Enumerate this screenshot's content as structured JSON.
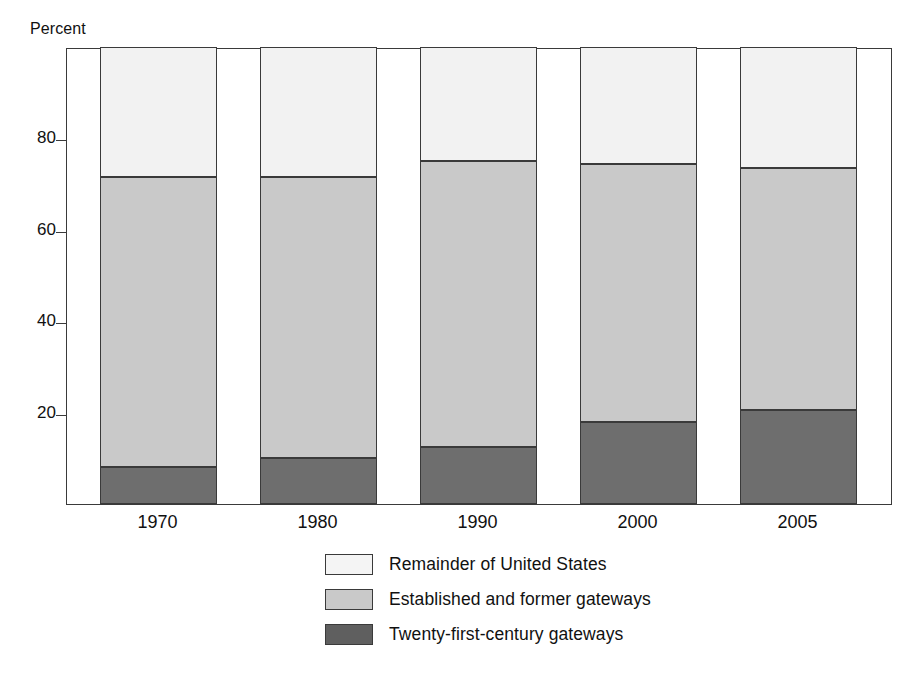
{
  "figure": {
    "cutoff_title": "",
    "unit_label": "Percent"
  },
  "axes": {
    "y_ticks": [
      "20",
      "40",
      "60",
      "80"
    ],
    "x_labels": [
      "1970",
      "1980",
      "1990",
      "2000",
      "2005"
    ]
  },
  "legend": {
    "items": [
      {
        "label": "Remainder of United States",
        "key": "remainder",
        "color": "#f2f2f2"
      },
      {
        "label": "Established and former gateways",
        "key": "established",
        "color": "#c9c9c9"
      },
      {
        "label": "Twenty-first-century gateways",
        "key": "twentyfirst",
        "color": "#6e6e6e"
      }
    ]
  },
  "chart_data": {
    "type": "bar",
    "subtype": "stacked-bar-100",
    "title": "",
    "xlabel": "",
    "ylabel": "Percent",
    "ylim": [
      0,
      100
    ],
    "yticks": [
      20,
      40,
      60,
      80
    ],
    "grid": false,
    "legend_position": "bottom-center",
    "categories": [
      "1970",
      "1980",
      "1990",
      "2000",
      "2005"
    ],
    "series": [
      {
        "name": "Twenty-first-century gateways",
        "color": "#6e6e6e",
        "values": [
          8.0,
          10.0,
          12.5,
          18.0,
          20.5
        ]
      },
      {
        "name": "Established and former gateways",
        "color": "#c9c9c9",
        "values": [
          63.5,
          61.5,
          62.5,
          56.5,
          53.0
        ]
      },
      {
        "name": "Remainder of United States",
        "color": "#f2f2f2",
        "values": [
          28.5,
          28.5,
          25.0,
          25.5,
          26.5
        ]
      }
    ],
    "cumulative_tops": {
      "twentyfirst": [
        8.0,
        10.0,
        12.5,
        18.0,
        20.5
      ],
      "established": [
        71.5,
        71.5,
        75.0,
        74.5,
        73.5
      ],
      "remainder": [
        100,
        100,
        100,
        100,
        100
      ]
    }
  }
}
